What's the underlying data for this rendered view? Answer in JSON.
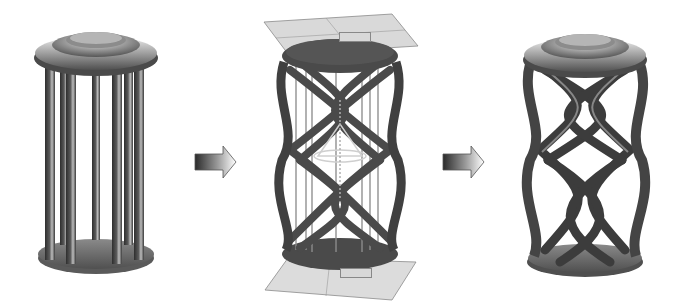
{
  "diagram": {
    "type": "process-illustration",
    "steps": [
      {
        "id": "step-1",
        "description": "straight-column model",
        "columns": 6,
        "form": "straight"
      },
      {
        "id": "step-2",
        "description": "twist setup with reference planes",
        "form": "twist-preview"
      },
      {
        "id": "step-3",
        "description": "twisted-column result",
        "form": "helical"
      }
    ],
    "arrows": [
      {
        "from": "step-1",
        "to": "step-2",
        "icon": "gradient-arrow-right-icon"
      },
      {
        "from": "step-2",
        "to": "step-3",
        "icon": "gradient-arrow-right-icon"
      }
    ],
    "plane_tags": {
      "top": "",
      "bottom": ""
    },
    "colors": {
      "background": "#ffffff",
      "metal_dark": "#3a3a3a",
      "metal_mid": "#6e6e6e",
      "metal_light": "#cfcfcf",
      "plane_fill": "#d9d9d9",
      "arrow_dark": "#2a2a2a",
      "arrow_light": "#ffffff"
    }
  }
}
